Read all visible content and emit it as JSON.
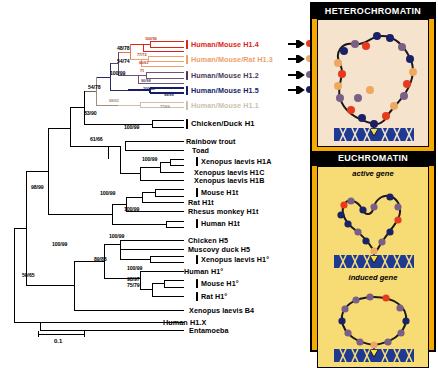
{
  "figure": {
    "type": "phylogenetic-tree-with-chromatin-diagram",
    "scale_bar_label": "0.1"
  },
  "tree": {
    "taxa": [
      {
        "id": "h14",
        "label": "Human/Mouse H1.4",
        "color": "red",
        "bar_color": "#e02314",
        "arrow": true,
        "dot_color": "#e8391d",
        "y": 44
      },
      {
        "id": "h13",
        "label": "Human/Mouse/Rat H1.3",
        "color": "orange",
        "bar_color": "#eda06a",
        "arrow": true,
        "dot_color": "#efa860",
        "y": 59
      },
      {
        "id": "h12",
        "label": "Human/Mouse H1.2",
        "color": "dark",
        "bar_color": "#4c3a55",
        "arrow": true,
        "dot_color": "#7a5f86",
        "y": 75
      },
      {
        "id": "h15",
        "label": "Human/Mouse H1.5",
        "color": "navy",
        "bar_color": "#171c66",
        "arrow": true,
        "dot_color": "#1b2166",
        "y": 90
      },
      {
        "id": "h11",
        "label": "Human/Mouse H1.1",
        "color": "tan",
        "bar_color": "#cbbfae",
        "arrow": false,
        "dot_color": "",
        "y": 105
      },
      {
        "id": "cduck",
        "label": "Chicken/Duck H1",
        "color": "black",
        "bar_color": "#000000",
        "arrow": false,
        "dot_color": "",
        "y": 124
      },
      {
        "id": "trout",
        "label": "Rainbow trout",
        "color": "black",
        "bar_color": "",
        "arrow": false,
        "dot_color": "",
        "y": 141
      },
      {
        "id": "toad",
        "label": "Toad",
        "color": "black",
        "bar_color": "",
        "arrow": false,
        "dot_color": "",
        "y": 150
      },
      {
        "id": "xh1a",
        "label": "Xenopus laevis H1A",
        "color": "black",
        "bar_color": "#000000",
        "arrow": false,
        "dot_color": "",
        "y": 162
      },
      {
        "id": "xh1c",
        "label": "Xenopus laevis H1C",
        "color": "black",
        "bar_color": "",
        "arrow": false,
        "dot_color": "",
        "y": 172
      },
      {
        "id": "xh1b",
        "label": "Xenopus laevis H1B",
        "color": "black",
        "bar_color": "",
        "arrow": false,
        "dot_color": "",
        "y": 180
      },
      {
        "id": "mh1t",
        "label": "Mouse H1t",
        "color": "black",
        "bar_color": "#000000",
        "arrow": false,
        "dot_color": "",
        "y": 192
      },
      {
        "id": "rh1t",
        "label": "Rat H1t",
        "color": "black",
        "bar_color": "#000000",
        "arrow": false,
        "dot_color": "",
        "y": 202
      },
      {
        "id": "rhesus",
        "label": "Rhesus monkey H1t",
        "color": "black",
        "bar_color": "",
        "arrow": false,
        "dot_color": "",
        "y": 211
      },
      {
        "id": "huh1t",
        "label": "Human H1t",
        "color": "black",
        "bar_color": "#000000",
        "arrow": false,
        "dot_color": "",
        "y": 224
      },
      {
        "id": "ch5",
        "label": "Chicken H5",
        "color": "black",
        "bar_color": "",
        "arrow": false,
        "dot_color": "",
        "y": 240
      },
      {
        "id": "mdh5",
        "label": "Muscovy duck H5",
        "color": "black",
        "bar_color": "",
        "arrow": false,
        "dot_color": "",
        "y": 249
      },
      {
        "id": "xh1o",
        "label": "Xenopus laevis H1°",
        "color": "black",
        "bar_color": "#000000",
        "arrow": false,
        "dot_color": "",
        "y": 259
      },
      {
        "id": "huh1o",
        "label": "Human H1°",
        "color": "black",
        "bar_color": "",
        "arrow": false,
        "dot_color": "",
        "y": 271
      },
      {
        "id": "mh1o",
        "label": "Mouse H1°",
        "color": "black",
        "bar_color": "#000000",
        "arrow": false,
        "dot_color": "",
        "y": 283
      },
      {
        "id": "rh1o",
        "label": "Rat H1°",
        "color": "black",
        "bar_color": "#000000",
        "arrow": false,
        "dot_color": "",
        "y": 296
      },
      {
        "id": "xb4",
        "label": "Xenopus laevis B4",
        "color": "black",
        "bar_color": "",
        "arrow": false,
        "dot_color": "",
        "y": 310
      },
      {
        "id": "h1x",
        "label": "Human H1.X",
        "color": "black",
        "bar_color": "",
        "arrow": false,
        "dot_color": "",
        "y": 322
      },
      {
        "id": "ento",
        "label": "Entamoeba",
        "color": "black",
        "bar_color": "",
        "arrow": false,
        "dot_color": "",
        "y": 330
      }
    ],
    "support_values": [
      {
        "value": "48/78",
        "x": 117,
        "y": 45
      },
      {
        "value": "54/74",
        "x": 117,
        "y": 58
      },
      {
        "value": "100/99",
        "x": 114,
        "y": 70
      },
      {
        "value": "54/78",
        "x": 92,
        "y": 84
      },
      {
        "value": "83/90",
        "x": 88,
        "y": 110
      },
      {
        "value": "100/99",
        "x": 128,
        "y": 124
      },
      {
        "value": "61/66",
        "x": 94,
        "y": 136
      },
      {
        "value": "100/99",
        "x": 146,
        "y": 156
      },
      {
        "value": "100/99",
        "x": 104,
        "y": 190
      },
      {
        "value": "100/99",
        "x": 128,
        "y": 206
      },
      {
        "value": "98/99",
        "x": 35,
        "y": 184
      },
      {
        "value": "100/99",
        "x": 56,
        "y": 241
      },
      {
        "value": "100/99",
        "x": 113,
        "y": 233
      },
      {
        "value": "89/88",
        "x": 98,
        "y": 256
      },
      {
        "value": "100/99",
        "x": 131,
        "y": 265
      },
      {
        "value": "50/65",
        "x": 26,
        "y": 272
      }
    ],
    "support_values_small": [
      {
        "value": "100/99",
        "x": 145,
        "y": 40
      },
      {
        "value": "77/72",
        "x": 137,
        "y": 52
      },
      {
        "value": "60/61",
        "x": 139,
        "y": 60
      },
      {
        "value": "71",
        "x": 140,
        "y": 68
      },
      {
        "value": "90/98",
        "x": 141,
        "y": 78
      },
      {
        "value": "100/99",
        "x": 143,
        "y": 86
      },
      {
        "value": "99/99",
        "x": 164,
        "y": 92
      },
      {
        "value": "68/65",
        "x": 113,
        "y": 98
      },
      {
        "value": "77/69",
        "x": 162,
        "y": 104
      }
    ],
    "support_values_stacked": [
      {
        "value": "98/97",
        "x": 131,
        "y": 277
      },
      {
        "value": "75/79",
        "x": 131,
        "y": 283
      }
    ]
  },
  "chromatin": {
    "heterochromatin_title": "HETEROCHROMATIN",
    "euchromatin_title": "EUCHROMATIN",
    "active_gene_label": "active gene",
    "induced_gene_label": "induced gene",
    "colors": {
      "panel_bg": "#f5a800",
      "hetero_stage_bg": "#f6e3cd",
      "eu_stage_bg": "#f7dc76",
      "dna_blue": "#1f3a93",
      "bead_navy": "#1b2166",
      "bead_red": "#e8391d",
      "bead_orange": "#efa860",
      "bead_purple": "#7a5f86"
    }
  }
}
